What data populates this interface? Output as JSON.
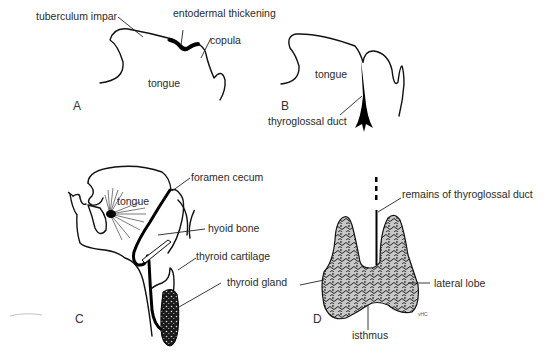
{
  "panels": {
    "A": {
      "letter": "A",
      "labels": {
        "tuberculum_impar": "tuberculum impar",
        "entodermal_thickening": "entodermal thickening",
        "copula": "copula",
        "tongue": "tongue"
      }
    },
    "B": {
      "letter": "B",
      "labels": {
        "tongue": "tongue",
        "thyroglossal_duct": "thyroglossal duct"
      }
    },
    "C": {
      "letter": "C",
      "labels": {
        "foramen_cecum": "foramen cecum",
        "tongue": "tongue",
        "hyoid_bone": "hyoid bone",
        "thyroid_cartilage": "thyroid cartilage",
        "thyroid_gland": "thyroid gland"
      }
    },
    "D": {
      "letter": "D",
      "labels": {
        "remains_of_thyroglossal_duct": "remains of thyroglossal duct",
        "lateral_lobe": "lateral lobe",
        "isthmus": "isthmus"
      },
      "signature": "vHC"
    }
  },
  "colors": {
    "ink": "#111111",
    "background": "#ffffff",
    "gland_fill": "#bdbdbd"
  }
}
